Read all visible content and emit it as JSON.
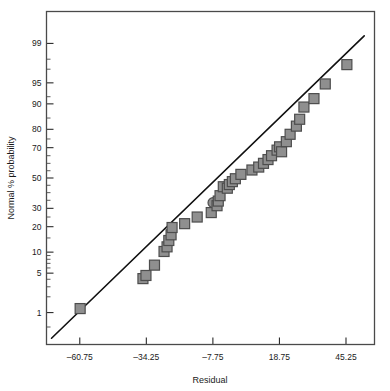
{
  "chart_data": {
    "type": "scatter",
    "title": "",
    "xlabel": "Residual",
    "ylabel": "Normal % probability",
    "grid": false,
    "legend": "none",
    "xlim": [
      -74.0,
      56.6
    ],
    "xticks": [
      -60.75,
      -34.25,
      -7.75,
      18.75,
      45.25
    ],
    "xticklabels": [
      "–60.75",
      "–34.25",
      "–7.75",
      "18.75",
      "45.25"
    ],
    "yticks": [
      1,
      5,
      10,
      20,
      30,
      50,
      70,
      80,
      90,
      95,
      99
    ],
    "yticklabels": [
      "1",
      "5",
      "10",
      "20",
      "30",
      "50",
      "70",
      "80",
      "90",
      "95",
      "99"
    ],
    "y_minor_ticks": [
      0.5,
      2,
      3,
      4,
      6,
      7,
      8,
      9,
      15,
      25,
      35,
      40,
      45,
      55,
      60,
      65,
      75,
      85,
      92,
      97,
      98
    ],
    "y_axis_scale": "normal-probability",
    "ylim_percent": [
      0.2,
      99.8
    ],
    "marker_shape": "square",
    "marker_fill": "#8f8f8f",
    "marker_edge": "#4d4d4d",
    "marker_size_px": 10,
    "reference_line": {
      "label": "normal reference line",
      "color": "#111111",
      "width_px": 1.6,
      "x_start": -72.0,
      "y_start_percent": 0.28,
      "x_end": 52.5,
      "y_end_percent": 99.3
    },
    "points": [
      {
        "x": -60.6,
        "y": 1.2,
        "shape": "square"
      },
      {
        "x": -35.6,
        "y": 4.1,
        "shape": "square"
      },
      {
        "x": -34.4,
        "y": 4.6,
        "shape": "square"
      },
      {
        "x": -31.0,
        "y": 6.6,
        "shape": "square"
      },
      {
        "x": -27.2,
        "y": 10.2,
        "shape": "square"
      },
      {
        "x": -26.0,
        "y": 11.7,
        "shape": "square"
      },
      {
        "x": -25.3,
        "y": 14.0,
        "shape": "square"
      },
      {
        "x": -24.4,
        "y": 16.3,
        "shape": "square"
      },
      {
        "x": -24.0,
        "y": 19.6,
        "shape": "square"
      },
      {
        "x": -19.0,
        "y": 21.5,
        "shape": "square"
      },
      {
        "x": -14.0,
        "y": 25.0,
        "shape": "square"
      },
      {
        "x": -8.4,
        "y": 27.5,
        "shape": "square"
      },
      {
        "x": -7.7,
        "y": 33.5,
        "shape": "circle"
      },
      {
        "x": -6.1,
        "y": 31.6,
        "shape": "square"
      },
      {
        "x": -5.6,
        "y": 34.5,
        "shape": "square"
      },
      {
        "x": -4.9,
        "y": 38.0,
        "shape": "square"
      },
      {
        "x": -3.6,
        "y": 44.0,
        "shape": "square"
      },
      {
        "x": -2.0,
        "y": 43.0,
        "shape": "square"
      },
      {
        "x": -1.2,
        "y": 45.5,
        "shape": "square"
      },
      {
        "x": 0.0,
        "y": 47.5,
        "shape": "square"
      },
      {
        "x": 1.2,
        "y": 49.5,
        "shape": "square"
      },
      {
        "x": 3.4,
        "y": 52.5,
        "shape": "square"
      },
      {
        "x": 7.8,
        "y": 55.5,
        "shape": "square"
      },
      {
        "x": 10.5,
        "y": 57.5,
        "shape": "square"
      },
      {
        "x": 12.4,
        "y": 60.0,
        "shape": "square"
      },
      {
        "x": 14.2,
        "y": 62.5,
        "shape": "square"
      },
      {
        "x": 15.6,
        "y": 65.0,
        "shape": "square"
      },
      {
        "x": 17.8,
        "y": 68.5,
        "shape": "square"
      },
      {
        "x": 18.8,
        "y": 70.5,
        "shape": "square"
      },
      {
        "x": 19.6,
        "y": 67.5,
        "shape": "square"
      },
      {
        "x": 21.5,
        "y": 73.5,
        "shape": "square"
      },
      {
        "x": 23.0,
        "y": 77.5,
        "shape": "square"
      },
      {
        "x": 25.5,
        "y": 81.5,
        "shape": "square"
      },
      {
        "x": 26.8,
        "y": 84.5,
        "shape": "square"
      },
      {
        "x": 28.5,
        "y": 89.0,
        "shape": "square"
      },
      {
        "x": 32.5,
        "y": 91.5,
        "shape": "square"
      },
      {
        "x": 37.0,
        "y": 94.8,
        "shape": "square"
      },
      {
        "x": 45.6,
        "y": 97.5,
        "shape": "square"
      }
    ]
  },
  "plot": {
    "frame_color": "#4a4a4a",
    "background": "#ffffff"
  }
}
